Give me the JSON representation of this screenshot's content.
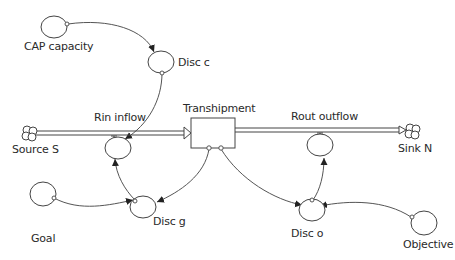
{
  "diagram": {
    "type": "stock-and-flow",
    "stock": {
      "label": "Transhipment"
    },
    "flows": [
      {
        "label": "Rin inflow",
        "from": "Source S",
        "to": "Transhipment"
      },
      {
        "label": "Rout outflow",
        "from": "Transhipment",
        "to": "Sink N"
      }
    ],
    "clouds": [
      {
        "label": "Source S"
      },
      {
        "label": "Sink N"
      }
    ],
    "converters": [
      {
        "label": "CAP capacity"
      },
      {
        "label": "Disc c"
      },
      {
        "label": "Goal"
      },
      {
        "label": "Disc g"
      },
      {
        "label": "Disc o"
      },
      {
        "label": "Objective"
      }
    ],
    "connectors": [
      {
        "from": "CAP capacity",
        "to": "Disc c"
      },
      {
        "from": "Disc c",
        "to": "Rin inflow"
      },
      {
        "from": "Goal",
        "to": "Disc g"
      },
      {
        "from": "Transhipment",
        "to": "Disc g"
      },
      {
        "from": "Disc g",
        "to": "Rin inflow"
      },
      {
        "from": "Transhipment",
        "to": "Disc o"
      },
      {
        "from": "Objective",
        "to": "Disc o"
      },
      {
        "from": "Disc o",
        "to": "Rout outflow"
      }
    ]
  }
}
